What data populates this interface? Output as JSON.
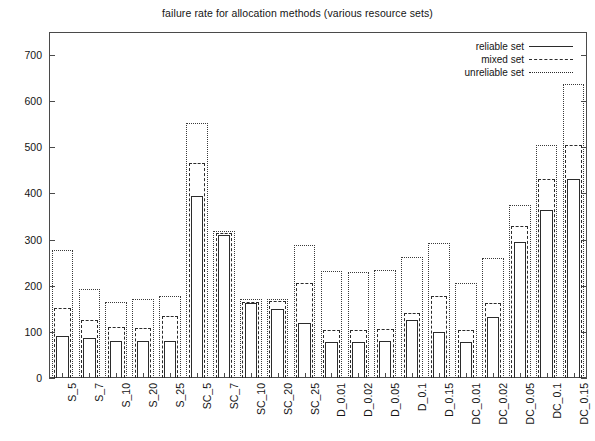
{
  "chart_data": {
    "type": "bar",
    "title": "failure rate for allocation methods (various resource sets)",
    "xlabel": "",
    "ylabel": "",
    "ylim": [
      0,
      750
    ],
    "yticks": [
      0,
      100,
      200,
      300,
      400,
      500,
      600,
      700
    ],
    "grid": false,
    "legend_position": "top-right",
    "bar_style": "nested-outline",
    "categories": [
      "S_5",
      "S_7",
      "S_10",
      "S_20",
      "S_25",
      "SC_5",
      "SC_7",
      "SC_10",
      "SC_20",
      "SC_25",
      "D_0.01",
      "D_0.02",
      "D_0.05",
      "D_0.1",
      "D_0.15",
      "DC_0.01",
      "DC_0.02",
      "DC_0.05",
      "DC_0.1",
      "DC_0.15"
    ],
    "series": [
      {
        "name": "reliable set",
        "line_style": "solid",
        "values": [
          92,
          86,
          80,
          80,
          80,
          395,
          310,
          163,
          150,
          120,
          78,
          78,
          80,
          125,
          100,
          78,
          133,
          295,
          365,
          432
        ]
      },
      {
        "name": "mixed set",
        "line_style": "dashed",
        "values": [
          152,
          125,
          110,
          108,
          135,
          465,
          315,
          165,
          168,
          205,
          105,
          105,
          107,
          140,
          178,
          105,
          163,
          330,
          432,
          505
        ]
      },
      {
        "name": "unreliable set",
        "line_style": "dotted",
        "values": [
          277,
          193,
          165,
          172,
          177,
          553,
          318,
          172,
          172,
          288,
          232,
          230,
          235,
          262,
          292,
          207,
          260,
          375,
          505,
          637
        ]
      }
    ]
  },
  "legend": {
    "entries": [
      {
        "label": "reliable set",
        "style": "solid"
      },
      {
        "label": "mixed set",
        "style": "dashed"
      },
      {
        "label": "unreliable set",
        "style": "dotted"
      }
    ]
  }
}
